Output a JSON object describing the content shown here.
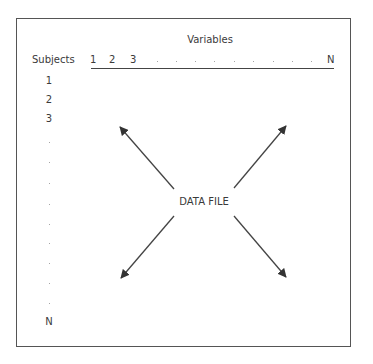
{
  "diagram": {
    "variables_label": "Variables",
    "subjects_label": "Subjects",
    "center_label": "DATA FILE",
    "variable_columns": [
      "1",
      "2",
      "3",
      "N"
    ],
    "variable_ellipsis_dots": 9,
    "subject_rows": [
      "1",
      "2",
      "3",
      "N"
    ],
    "subject_ellipsis_dots": 9,
    "arrows": [
      {
        "direction": "up-left",
        "from": [
          174,
          189
        ],
        "to": [
          120,
          127
        ]
      },
      {
        "direction": "up-right",
        "from": [
          234,
          188
        ],
        "to": [
          286,
          126
        ]
      },
      {
        "direction": "down-left",
        "from": [
          174,
          216
        ],
        "to": [
          121,
          278
        ]
      },
      {
        "direction": "down-right",
        "from": [
          234,
          216
        ],
        "to": [
          286,
          277
        ]
      }
    ],
    "colors": {
      "line": "#444444",
      "text": "#3a3a3a",
      "border": "#555555"
    }
  }
}
